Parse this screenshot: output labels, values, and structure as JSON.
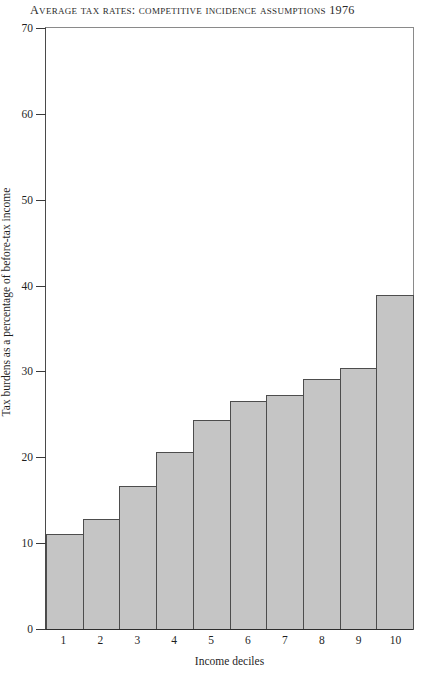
{
  "chart_data": {
    "type": "bar",
    "title": "Average Tax Rates:  Competitive Incidence Assumptions 1976",
    "xlabel": "Income deciles",
    "ylabel": "Tax burdens as a percentage of before-tax income",
    "categories": [
      "1",
      "2",
      "3",
      "4",
      "5",
      "6",
      "7",
      "8",
      "9",
      "10"
    ],
    "values": [
      11.1,
      12.8,
      16.7,
      20.6,
      24.3,
      26.5,
      27.3,
      29.1,
      30.4,
      38.9
    ],
    "ylim": [
      0,
      70
    ],
    "yticks": [
      0,
      10,
      20,
      30,
      40,
      50,
      60,
      70
    ],
    "ytick_labels": [
      "0",
      "10",
      "20",
      "30",
      "40",
      "50",
      "60",
      "70"
    ],
    "grid": false,
    "legend": "none",
    "bar_fill_color": "#c5c5c5",
    "bar_edge_color": "#4d4d4d",
    "axis_color": "#3a3a3a"
  }
}
